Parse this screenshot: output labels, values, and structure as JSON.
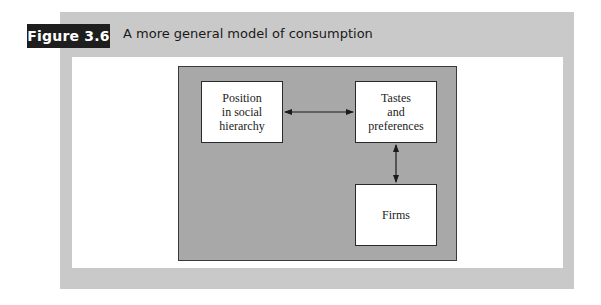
{
  "figure": {
    "label": "Figure 3.6",
    "caption": "A more general model of consumption"
  },
  "diagram": {
    "nodes": [
      {
        "id": "position",
        "label": "Position\nin social\nhierarchy"
      },
      {
        "id": "tastes",
        "label": "Tastes\nand\npreferences"
      },
      {
        "id": "firms",
        "label": "Firms"
      }
    ],
    "edges": [
      {
        "from": "position",
        "to": "tastes",
        "direction": "bidirectional"
      },
      {
        "from": "tastes",
        "to": "firms",
        "direction": "bidirectional"
      }
    ]
  },
  "colors": {
    "badge_bg": "#1e1e1e",
    "panel_bg": "#c9c9c9",
    "frame_bg": "#a8a8a8",
    "node_bg": "#ffffff"
  }
}
